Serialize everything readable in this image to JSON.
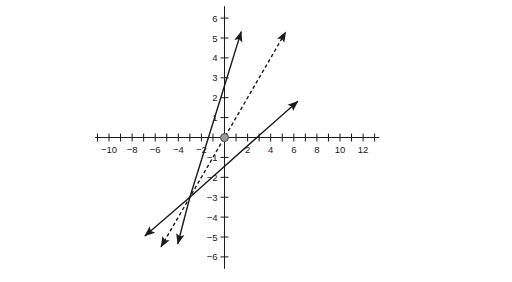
{
  "chart_data": {
    "type": "line",
    "title": "",
    "xlabel": "",
    "ylabel": "",
    "xlim": [
      -11.2,
      13.4
    ],
    "ylim": [
      -6.6,
      6.6
    ],
    "grid": false,
    "legend": null,
    "x_tick_labels": [
      "-10",
      "-8",
      "-6",
      "-4",
      "-2",
      "2",
      "4",
      "6",
      "8",
      "10",
      "12"
    ],
    "x_tick_values": [
      -10,
      -8,
      -6,
      -4,
      -2,
      2,
      4,
      6,
      8,
      10,
      12
    ],
    "x_minor_tick_values": [
      -11,
      -9,
      -7,
      -5,
      -3,
      -1,
      1,
      3,
      5,
      7,
      9,
      11,
      13
    ],
    "y_tick_labels": [
      "6",
      "5",
      "4",
      "3",
      "2",
      "1",
      "-1",
      "-2",
      "-3",
      "-4",
      "-5",
      "-6"
    ],
    "y_tick_values": [
      6,
      5,
      4,
      3,
      2,
      1,
      -1,
      -2,
      -3,
      -4,
      -5,
      -6
    ],
    "annotations": [
      {
        "name": "origin-point",
        "x": 0,
        "y": 0,
        "marker": "filled-circle",
        "color": "#9a9a9a"
      }
    ],
    "series": [
      {
        "name": "steep-solid-line",
        "style": "solid",
        "color": "#1a1a1a",
        "slope": 1.87,
        "intercept": 2.6,
        "arrows": "both",
        "points": [
          [
            -4.05,
            -5.35
          ],
          [
            -3,
            -3
          ],
          [
            -1.39,
            0
          ],
          [
            0,
            2.6
          ],
          [
            1.45,
            5.32
          ]
        ]
      },
      {
        "name": "dashed-line",
        "style": "dashed",
        "color": "#1a1a1a",
        "slope": 1,
        "intercept": 0,
        "arrows": "both",
        "points": [
          [
            -5.5,
            -5.5
          ],
          [
            -3,
            -3
          ],
          [
            0,
            0
          ],
          [
            5.3,
            5.3
          ]
        ]
      },
      {
        "name": "shallow-solid-line",
        "style": "solid",
        "color": "#1a1a1a",
        "slope": 0.51,
        "intercept": -1.43,
        "arrows": "both",
        "points": [
          [
            -6.9,
            -4.95
          ],
          [
            -3,
            -3
          ],
          [
            2.8,
            0
          ],
          [
            6.35,
            1.82
          ]
        ]
      }
    ]
  }
}
